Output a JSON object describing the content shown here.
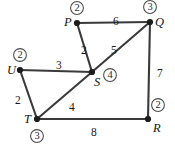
{
  "figure": {
    "type": "undirected-weighted-graph",
    "background_color": "#ffffff",
    "edge_color": "#3a3a3a",
    "node_color": "#1c1c1c",
    "badge_stroke_color": "#4a4a4a"
  },
  "nodes": [
    {
      "id": "P",
      "label": "P",
      "badge": "2",
      "x": 77,
      "y": 23,
      "label_dx": -13,
      "label_dy": -7,
      "badge_x": 77,
      "badge_y": 8
    },
    {
      "id": "Q",
      "label": "Q",
      "badge": "3",
      "x": 150,
      "y": 22,
      "label_dx": 5,
      "label_dy": -6,
      "badge_x": 150,
      "badge_y": 7
    },
    {
      "id": "U",
      "label": "U",
      "badge": "2",
      "x": 20,
      "y": 70,
      "label_dx": -13,
      "label_dy": -6,
      "badge_x": 20,
      "badge_y": 55
    },
    {
      "id": "S",
      "label": "S",
      "badge": "4",
      "x": 92,
      "y": 72,
      "label_dx": 2,
      "label_dy": 4,
      "badge_x": 110,
      "badge_y": 75
    },
    {
      "id": "T",
      "label": "T",
      "badge": "3",
      "x": 37,
      "y": 119,
      "label_dx": -13,
      "label_dy": -6,
      "badge_x": 37,
      "badge_y": 136
    },
    {
      "id": "R",
      "label": "R",
      "badge": "2",
      "x": 148,
      "y": 119,
      "label_dx": 5,
      "label_dy": 3,
      "badge_x": 158,
      "badge_y": 105
    }
  ],
  "edges": [
    {
      "from": "P",
      "to": "Q",
      "weight": "6",
      "label_x": 113,
      "label_y": 16
    },
    {
      "from": "P",
      "to": "S",
      "weight": "2",
      "label_x": 81,
      "label_y": 45
    },
    {
      "from": "S",
      "to": "Q",
      "weight": "5",
      "label_x": 111,
      "label_y": 45
    },
    {
      "from": "U",
      "to": "S",
      "weight": "3",
      "label_x": 56,
      "label_y": 60
    },
    {
      "from": "U",
      "to": "T",
      "weight": "2",
      "label_x": 15,
      "label_y": 95
    },
    {
      "from": "T",
      "to": "S",
      "weight": "4",
      "label_x": 69,
      "label_y": 102
    },
    {
      "from": "T",
      "to": "R",
      "weight": "8",
      "label_x": 91,
      "label_y": 127
    },
    {
      "from": "Q",
      "to": "R",
      "weight": "7",
      "label_x": 157,
      "label_y": 68
    }
  ]
}
